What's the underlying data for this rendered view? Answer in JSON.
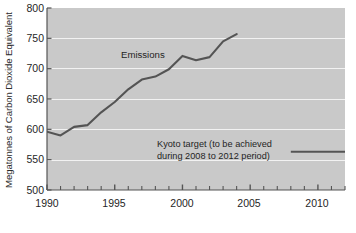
{
  "chart_data": {
    "type": "line",
    "title": "",
    "xlabel": "",
    "ylabel": "Megatonnes of Carbon Dioxide Equivalent",
    "xlim": [
      1990,
      2012
    ],
    "ylim": [
      500,
      800
    ],
    "grid": true,
    "legend_position": "inline-annotation",
    "y_ticks": [
      500,
      550,
      600,
      650,
      700,
      750,
      800
    ],
    "y_tick_labels": [
      "500",
      "550",
      "600",
      "650",
      "700",
      "750",
      "800"
    ],
    "x_ticks": [
      1990,
      1991,
      1992,
      1993,
      1994,
      1995,
      1996,
      1997,
      1998,
      1999,
      2000,
      2001,
      2002,
      2003,
      2004,
      2005,
      2006,
      2007,
      2008,
      2009,
      2010,
      2011,
      2012
    ],
    "x_tick_labels_shown": [
      "1990",
      "1995",
      "2000",
      "2005",
      "2010"
    ],
    "x_tick_labels_shown_values": [
      1990,
      1995,
      2000,
      2005,
      2010
    ],
    "series": [
      {
        "name": "Emissions",
        "label": "Emissions",
        "color": "#545454",
        "x": [
          1990,
          1991,
          1992,
          1993,
          1994,
          1995,
          1996,
          1997,
          1998,
          1999,
          2000,
          2001,
          2002,
          2003,
          2004
        ],
        "values": [
          596,
          590,
          604,
          607,
          628,
          645,
          666,
          682,
          687,
          699,
          721,
          714,
          719,
          745,
          757
        ]
      },
      {
        "name": "Kyoto target",
        "label": "Kyoto target (to be achieved during 2008 to 2012 period)",
        "label_line_1": "Kyoto target (to be achieved",
        "label_line_2": "during 2008 to 2012 period)",
        "color": "#545454",
        "x": [
          2008,
          2012
        ],
        "values": [
          563,
          563
        ]
      }
    ],
    "plot_background_color": "#c9c9c9",
    "gridline_color": "#f2f2f2",
    "axis_color": "#555555"
  }
}
